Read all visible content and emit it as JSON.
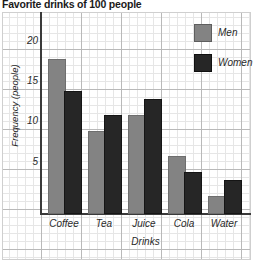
{
  "chart_data": {
    "type": "bar",
    "title": "Favorite drinks of 100 people",
    "xlabel": "Drinks",
    "ylabel": "Frequency (people)",
    "categories": [
      "Coffee",
      "Tea",
      "Juice",
      "Cola",
      "Water"
    ],
    "series": [
      {
        "name": "Men",
        "values": [
          19,
          10,
          12,
          7,
          2
        ],
        "color": "#838383"
      },
      {
        "name": "Women",
        "values": [
          15,
          12,
          14,
          5,
          4
        ],
        "color": "#262626"
      }
    ],
    "yticks": [
      5,
      10,
      15,
      20
    ],
    "ylim": [
      0,
      25
    ],
    "grid": true,
    "legend_position": "top-right"
  },
  "legend": {
    "men_label": "Men",
    "women_label": "Women"
  }
}
